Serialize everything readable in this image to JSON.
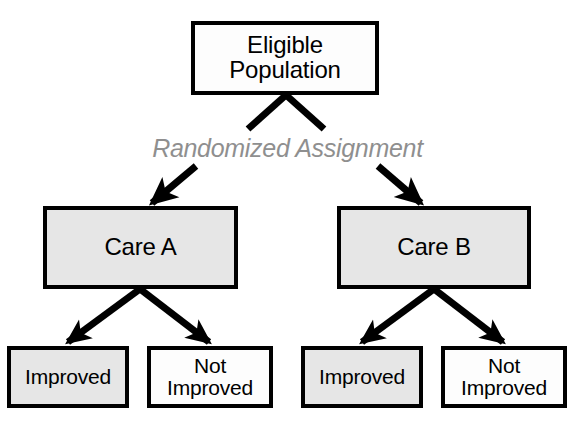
{
  "diagram": {
    "type": "flowchart",
    "background_color": "#ffffff",
    "border_color": "#000000",
    "gray_fill_color": "#e6e6e6",
    "white_fill_color": "#fdfdfd",
    "annotation_color": "#8f8f8f",
    "nodes": {
      "eligible_population": {
        "label": "Eligible\nPopulation",
        "fill": "white"
      },
      "care_a": {
        "label": "Care A",
        "fill": "gray"
      },
      "care_b": {
        "label": "Care B",
        "fill": "gray"
      },
      "improved_a": {
        "label": "Improved",
        "fill": "gray"
      },
      "not_improved_a": {
        "label": "Not\nImproved",
        "fill": "white"
      },
      "improved_b": {
        "label": "Improved",
        "fill": "gray"
      },
      "not_improved_b": {
        "label": "Not\nImproved",
        "fill": "white"
      }
    },
    "annotations": {
      "randomization": "Randomized Assignment"
    },
    "edges": [
      {
        "from": "eligible_population",
        "to": "care_a",
        "label": "Randomized Assignment"
      },
      {
        "from": "eligible_population",
        "to": "care_b",
        "label": "Randomized Assignment"
      },
      {
        "from": "care_a",
        "to": "improved_a",
        "label": ""
      },
      {
        "from": "care_a",
        "to": "not_improved_a",
        "label": ""
      },
      {
        "from": "care_b",
        "to": "improved_b",
        "label": ""
      },
      {
        "from": "care_b",
        "to": "not_improved_b",
        "label": ""
      }
    ]
  }
}
